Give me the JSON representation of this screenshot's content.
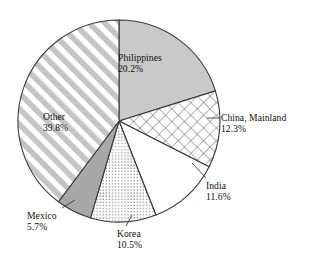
{
  "chart_data": {
    "type": "pie",
    "title": "",
    "xlabel": "",
    "ylabel": "",
    "legend_position": "none",
    "grid": false,
    "units": "percent",
    "start_angle_deg": 0,
    "direction": "clockwise",
    "categories": [
      "Philippines",
      "China, Mainland",
      "India",
      "Korea",
      "Mexico",
      "Other"
    ],
    "values": [
      20.2,
      12.3,
      11.6,
      10.5,
      5.7,
      39.8
    ],
    "slices": [
      {
        "label": "Philippines",
        "value": 20.2,
        "value_label": "20.2%",
        "fill": "solid-light-gray",
        "color": "#c9c9c9",
        "label_placement": "inside",
        "label_x": 118,
        "label_y": 52
      },
      {
        "label": "China, Mainland",
        "value": 12.3,
        "value_label": "12.3%",
        "fill": "crosshatch",
        "color": "#ffffff",
        "label_placement": "outside",
        "label_x": 221,
        "label_y": 112
      },
      {
        "label": "India",
        "value": 11.6,
        "value_label": "11.6%",
        "fill": "none",
        "color": "#ffffff",
        "label_placement": "outside",
        "label_x": 206,
        "label_y": 180
      },
      {
        "label": "Korea",
        "value": 10.5,
        "value_label": "10.5%",
        "fill": "dotted",
        "color": "#ffffff",
        "label_placement": "outside",
        "label_x": 117,
        "label_y": 228
      },
      {
        "label": "Mexico",
        "value": 5.7,
        "value_label": "5.7%",
        "fill": "solid-medium-gray",
        "color": "#a8a8a8",
        "label_placement": "outside",
        "label_x": 27,
        "label_y": 210
      },
      {
        "label": "Other",
        "value": 39.8,
        "value_label": "39.8%",
        "fill": "diagonal-stripes",
        "color": "#bdbdbd",
        "label_placement": "inside",
        "label_x": 43,
        "label_y": 111
      }
    ],
    "geometry": {
      "center_x": 119,
      "center_y": 121,
      "radius": 101
    },
    "stroke_color": "#3a3a3a",
    "background": "#ffffff"
  }
}
